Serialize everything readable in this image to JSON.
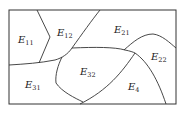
{
  "diagram": {
    "type": "region-partition",
    "regions": [
      {
        "id": "E11",
        "base": "E",
        "sub": "11",
        "x": 18,
        "y": 43
      },
      {
        "id": "E12",
        "base": "E",
        "sub": "12",
        "x": 57,
        "y": 36
      },
      {
        "id": "E21",
        "base": "E",
        "sub": "21",
        "x": 114,
        "y": 33
      },
      {
        "id": "E22",
        "base": "E",
        "sub": "22",
        "x": 151,
        "y": 60
      },
      {
        "id": "E31",
        "base": "E",
        "sub": "31",
        "x": 25,
        "y": 88
      },
      {
        "id": "E32",
        "base": "E",
        "sub": "32",
        "x": 80,
        "y": 75
      },
      {
        "id": "E4",
        "base": "E",
        "sub": "4",
        "x": 128,
        "y": 90
      }
    ],
    "colors": {
      "stroke": "#333333",
      "background": "#ffffff"
    }
  }
}
